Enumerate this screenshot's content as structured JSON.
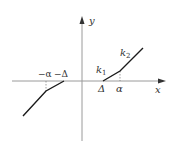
{
  "diagram": {
    "type": "piecewise-linear dead-zone characteristic",
    "axes": {
      "x_label": "x",
      "y_label": "y"
    },
    "tick_labels": {
      "neg_alpha": "−α",
      "neg_delta": "−Δ",
      "pos_delta": "Δ",
      "pos_alpha": "α"
    },
    "slope_labels": {
      "k1": {
        "base": "k",
        "sub": "1"
      },
      "k2": {
        "base": "k",
        "sub": "2"
      }
    },
    "colors": {
      "axis": "#999999",
      "curve": "#1a1a1a",
      "text": "#333333"
    }
  }
}
